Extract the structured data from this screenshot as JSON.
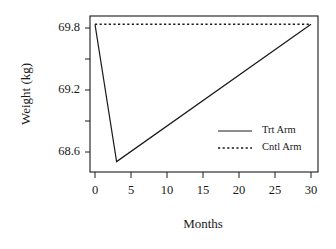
{
  "chart_data": {
    "type": "line",
    "title": "",
    "xlabel": "Months",
    "ylabel": "Weight (kg)",
    "xlim": [
      0,
      30
    ],
    "ylim": [
      68.45,
      69.95
    ],
    "xticks": [
      0,
      5,
      10,
      15,
      20,
      25,
      30
    ],
    "xtick_labels": [
      "0",
      "5",
      "10",
      "15",
      "20",
      "25",
      "30"
    ],
    "yticks": [
      68.6,
      69.2,
      69.8
    ],
    "ytick_labels": [
      "68.6",
      "69.2",
      "69.8"
    ],
    "y_minor_ticks": [
      68.9,
      69.5
    ],
    "grid": false,
    "legend_position": "center-right",
    "series": [
      {
        "name": "Trt Arm",
        "style": "solid",
        "color": "#1a1a1a",
        "x": [
          0,
          3,
          30
        ],
        "y": [
          69.87,
          68.55,
          69.87
        ]
      },
      {
        "name": "Cntl Arm",
        "style": "dotted",
        "color": "#1a1a1a",
        "x": [
          0,
          30
        ],
        "y": [
          69.87,
          69.87
        ]
      }
    ]
  },
  "axes": {
    "y_title": "Weight (kg)",
    "x_title": "Months",
    "y_labels": {
      "top": "69.8",
      "middle": "69.2",
      "bottom": "68.6"
    },
    "x_labels": {
      "t0": "0",
      "t1": "5",
      "t2": "10",
      "t3": "15",
      "t4": "20",
      "t5": "25",
      "t6": "30"
    }
  },
  "legend": {
    "entries": [
      {
        "label": "Trt Arm",
        "style": "solid"
      },
      {
        "label": "Cntl Arm",
        "style": "dotted"
      }
    ]
  },
  "colors": {
    "ink": "#1a1a1a",
    "background": "#ffffff"
  }
}
